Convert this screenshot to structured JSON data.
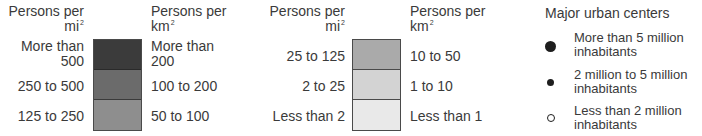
{
  "legend_density": {
    "group1": {
      "mi_header": "Persons per",
      "mi_unit": "mi",
      "km_header": "Persons per",
      "km_unit": "km",
      "sup": "2",
      "rows": [
        {
          "mi_line1": "More than",
          "mi_line2": "500",
          "km_line1": "More than",
          "km_line2": "200",
          "color": "#3b3b3b"
        },
        {
          "mi_line1": "250 to 500",
          "mi_line2": "",
          "km_line1": "100 to 200",
          "km_line2": "",
          "color": "#6b6b6b"
        },
        {
          "mi_line1": "125 to 250",
          "mi_line2": "",
          "km_line1": "50 to 100",
          "km_line2": "",
          "color": "#8e8e8e"
        }
      ]
    },
    "group2": {
      "mi_header": "Persons per",
      "mi_unit": "mi",
      "km_header": "Persons per",
      "km_unit": "km",
      "sup": "2",
      "rows": [
        {
          "mi_label": "25 to 125",
          "km_label": "10 to 50",
          "color": "#aaaaaa"
        },
        {
          "mi_label": "2 to 25",
          "km_label": "1 to 10",
          "color": "#d3d3d3"
        },
        {
          "mi_label": "Less than 2",
          "km_label": "Less than 1",
          "color": "#e9e9e9"
        }
      ]
    }
  },
  "legend_cities": {
    "title": "Major urban centers",
    "items": [
      {
        "line1": "More than 5 million",
        "line2": "inhabitants",
        "symbol": "large-filled-dot"
      },
      {
        "line1": "2 million to 5 million",
        "line2": "inhabitants",
        "symbol": "small-filled-dot"
      },
      {
        "line1": "Less than 2 million",
        "line2": "inhabitants",
        "symbol": "hollow-dot"
      }
    ]
  }
}
